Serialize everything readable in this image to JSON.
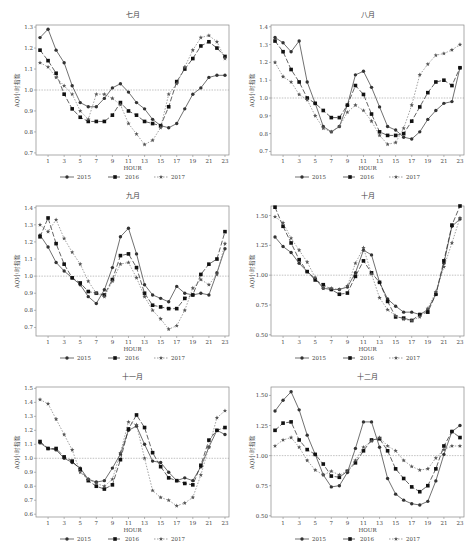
{
  "chart_data": [
    {
      "type": "line",
      "title": "七月",
      "xlabel": "HOUR",
      "ylabel": "AQI小时指数",
      "x": [
        0,
        1,
        2,
        3,
        4,
        5,
        6,
        7,
        8,
        9,
        10,
        11,
        12,
        13,
        14,
        15,
        16,
        17,
        18,
        19,
        20,
        21,
        22,
        23
      ],
      "xticks": [
        1,
        3,
        5,
        7,
        9,
        11,
        13,
        15,
        17,
        19,
        21,
        23
      ],
      "ylim": [
        0.69,
        1.31
      ],
      "yticks": [
        0.7,
        0.8,
        0.9,
        1.0,
        1.1,
        1.2,
        1.3
      ],
      "ytick_labels": [
        "0.7",
        "0.8",
        "0.9",
        "1.0",
        "1.1",
        "1.2",
        "1.3"
      ],
      "reference_line": 1.0,
      "series": [
        {
          "name": "2015",
          "values": [
            1.25,
            1.29,
            1.19,
            1.13,
            1.02,
            0.94,
            0.92,
            0.92,
            0.96,
            1.01,
            1.03,
            0.99,
            0.94,
            0.91,
            0.86,
            0.83,
            0.82,
            0.84,
            0.91,
            0.98,
            1.01,
            1.06,
            1.07,
            1.07
          ]
        },
        {
          "name": "2016",
          "values": [
            1.19,
            1.14,
            1.08,
            0.98,
            0.91,
            0.87,
            0.85,
            0.85,
            0.85,
            0.88,
            0.94,
            0.9,
            0.88,
            0.85,
            0.84,
            0.83,
            0.92,
            1.04,
            1.1,
            1.15,
            1.21,
            1.23,
            1.2,
            1.16
          ]
        },
        {
          "name": "2017",
          "values": [
            1.13,
            1.11,
            1.06,
            1.02,
            0.98,
            0.9,
            0.86,
            0.98,
            0.98,
            0.96,
            0.93,
            0.84,
            0.79,
            0.74,
            0.76,
            0.82,
            0.98,
            1.03,
            1.11,
            1.19,
            1.25,
            1.26,
            1.23,
            1.15
          ]
        }
      ]
    },
    {
      "type": "line",
      "title": "八月",
      "xlabel": "HOUR",
      "ylabel": "AQI小时指数",
      "x": [
        0,
        1,
        2,
        3,
        4,
        5,
        6,
        7,
        8,
        9,
        10,
        11,
        12,
        13,
        14,
        15,
        16,
        17,
        18,
        19,
        20,
        21,
        22,
        23
      ],
      "xticks": [
        1,
        3,
        5,
        7,
        9,
        11,
        13,
        15,
        17,
        19,
        21,
        23
      ],
      "ylim": [
        0.68,
        1.41
      ],
      "yticks": [
        0.7,
        0.8,
        0.9,
        1.0,
        1.1,
        1.2,
        1.3,
        1.4
      ],
      "ytick_labels": [
        "0.7",
        "0.8",
        "0.9",
        "1.0",
        "1.1",
        "1.2",
        "1.3",
        "1.4"
      ],
      "reference_line": 1.0,
      "series": [
        {
          "name": "2015",
          "values": [
            1.34,
            1.31,
            1.26,
            1.32,
            1.09,
            0.97,
            0.84,
            0.81,
            0.84,
            0.96,
            1.13,
            1.15,
            1.06,
            0.95,
            0.84,
            0.82,
            0.78,
            0.77,
            0.81,
            0.88,
            0.93,
            0.97,
            0.98,
            1.17
          ]
        },
        {
          "name": "2016",
          "values": [
            1.32,
            1.26,
            1.16,
            1.09,
            1.0,
            0.97,
            0.93,
            0.89,
            0.89,
            0.96,
            1.07,
            1.02,
            0.91,
            0.81,
            0.79,
            0.79,
            0.8,
            0.87,
            0.95,
            1.03,
            1.09,
            1.1,
            1.07,
            1.17
          ]
        },
        {
          "name": "2017",
          "values": [
            1.2,
            1.12,
            1.09,
            1.02,
            0.99,
            0.9,
            0.83,
            0.81,
            0.84,
            0.92,
            0.96,
            0.93,
            0.87,
            0.79,
            0.74,
            0.75,
            0.83,
            0.96,
            1.13,
            1.19,
            1.24,
            1.25,
            1.27,
            1.3
          ]
        }
      ]
    },
    {
      "type": "line",
      "title": "九月",
      "xlabel": "HOUR",
      "ylabel": "AQI小时指数",
      "x": [
        0,
        1,
        2,
        3,
        4,
        5,
        6,
        7,
        8,
        9,
        10,
        11,
        12,
        13,
        14,
        15,
        16,
        17,
        18,
        19,
        20,
        21,
        22,
        23
      ],
      "xticks": [
        1,
        3,
        5,
        7,
        9,
        11,
        13,
        15,
        17,
        19,
        21,
        23
      ],
      "ylim": [
        0.65,
        1.41
      ],
      "yticks": [
        0.7,
        0.8,
        0.9,
        1.0,
        1.1,
        1.2,
        1.3,
        1.4
      ],
      "ytick_labels": [
        "0.7",
        "0.8",
        "0.9",
        "1.0",
        "1.1",
        "1.2",
        "1.3",
        "1.4"
      ],
      "reference_line": 1.0,
      "series": [
        {
          "name": "2015",
          "values": [
            1.24,
            1.17,
            1.08,
            1.03,
            0.99,
            0.95,
            0.88,
            0.84,
            0.92,
            1.05,
            1.23,
            1.28,
            1.13,
            0.95,
            0.89,
            0.87,
            0.85,
            0.94,
            0.9,
            0.89,
            0.9,
            0.89,
            1.02,
            1.16
          ]
        },
        {
          "name": "2016",
          "values": [
            1.23,
            1.34,
            1.19,
            1.07,
            0.99,
            0.96,
            0.91,
            0.9,
            0.89,
            0.98,
            1.12,
            1.13,
            1.05,
            0.9,
            0.83,
            0.82,
            0.81,
            0.81,
            0.87,
            0.89,
            1.01,
            1.07,
            1.1,
            1.26
          ]
        },
        {
          "name": "2017",
          "values": [
            1.3,
            1.26,
            1.33,
            1.22,
            1.14,
            1.07,
            0.97,
            0.9,
            0.88,
            0.97,
            1.07,
            1.08,
            0.99,
            0.88,
            0.8,
            0.75,
            0.69,
            0.71,
            0.8,
            0.93,
            0.98,
            0.95,
            1.01,
            1.19
          ]
        }
      ]
    },
    {
      "type": "line",
      "title": "十月",
      "xlabel": "HOUR",
      "ylabel": "AQI小时指数",
      "x": [
        0,
        1,
        2,
        3,
        4,
        5,
        6,
        7,
        8,
        9,
        10,
        11,
        12,
        13,
        14,
        15,
        16,
        17,
        18,
        19,
        20,
        21,
        22,
        23
      ],
      "xticks": [
        1,
        3,
        5,
        7,
        9,
        11,
        13,
        15,
        17,
        19,
        21,
        23
      ],
      "ylim": [
        0.49,
        1.58
      ],
      "yticks": [
        0.5,
        0.75,
        1.0,
        1.25,
        1.5
      ],
      "ytick_labels": [
        "0.50",
        "0.75",
        "1.00",
        "1.25",
        "1.50"
      ],
      "reference_line": 1.0,
      "series": [
        {
          "name": "2015",
          "values": [
            1.32,
            1.24,
            1.19,
            1.1,
            1.03,
            0.97,
            0.89,
            0.88,
            0.88,
            0.9,
            1.02,
            1.21,
            1.17,
            0.94,
            0.8,
            0.74,
            0.69,
            0.69,
            0.67,
            0.71,
            0.84,
            1.1,
            1.41,
            1.47
          ]
        },
        {
          "name": "2016",
          "values": [
            1.57,
            1.41,
            1.27,
            1.13,
            1.03,
            0.96,
            0.92,
            0.88,
            0.84,
            0.85,
            0.99,
            1.12,
            1.02,
            0.94,
            0.78,
            0.65,
            0.64,
            0.62,
            0.67,
            0.69,
            0.84,
            1.12,
            1.42,
            1.58
          ]
        },
        {
          "name": "2017",
          "values": [
            1.49,
            1.44,
            1.31,
            1.21,
            1.11,
            0.98,
            0.89,
            0.89,
            0.88,
            0.91,
            1.1,
            1.23,
            1.01,
            0.81,
            0.71,
            0.66,
            0.63,
            0.62,
            0.65,
            0.72,
            0.86,
            1.07,
            1.27,
            1.48
          ]
        }
      ]
    },
    {
      "type": "line",
      "title": "十一月",
      "xlabel": "HOUR",
      "ylabel": "AQI小时指数",
      "x": [
        0,
        1,
        2,
        3,
        4,
        5,
        6,
        7,
        8,
        9,
        10,
        11,
        12,
        13,
        14,
        15,
        16,
        17,
        18,
        19,
        20,
        21,
        22,
        23
      ],
      "xticks": [
        1,
        3,
        5,
        7,
        9,
        11,
        13,
        15,
        17,
        19,
        21,
        23
      ],
      "ylim": [
        0.58,
        1.51
      ],
      "yticks": [
        0.6,
        0.7,
        0.8,
        0.9,
        1.0,
        1.1,
        1.2,
        1.3,
        1.4,
        1.5
      ],
      "ytick_labels": [
        "0.6",
        "0.7",
        "0.8",
        "0.9",
        "1.0",
        "1.1",
        "1.2",
        "1.3",
        "1.4",
        "1.5"
      ],
      "reference_line": 1.0,
      "series": [
        {
          "name": "2015",
          "values": [
            1.11,
            1.07,
            1.06,
            1.0,
            0.97,
            0.93,
            0.85,
            0.83,
            0.84,
            0.93,
            1.03,
            1.2,
            1.23,
            1.1,
            0.98,
            0.97,
            0.9,
            0.84,
            0.86,
            0.84,
            0.94,
            1.08,
            1.2,
            1.17
          ]
        },
        {
          "name": "2016",
          "values": [
            1.12,
            1.07,
            1.07,
            1.01,
            0.98,
            0.92,
            0.84,
            0.8,
            0.78,
            0.81,
            0.99,
            1.21,
            1.31,
            1.22,
            1.04,
            0.94,
            0.86,
            0.84,
            0.82,
            0.81,
            0.95,
            1.13,
            1.2,
            1.22
          ]
        },
        {
          "name": "2017",
          "values": [
            1.42,
            1.39,
            1.28,
            1.17,
            1.06,
            0.9,
            0.85,
            0.82,
            0.8,
            0.85,
            1.04,
            1.26,
            1.24,
            1.0,
            0.77,
            0.72,
            0.7,
            0.66,
            0.68,
            0.72,
            0.88,
            1.08,
            1.29,
            1.34
          ]
        }
      ]
    },
    {
      "type": "line",
      "title": "十二月",
      "xlabel": "HOUR",
      "ylabel": "AQI小时指数",
      "x": [
        0,
        1,
        2,
        3,
        4,
        5,
        6,
        7,
        8,
        9,
        10,
        11,
        12,
        13,
        14,
        15,
        16,
        17,
        18,
        19,
        20,
        21,
        22,
        23
      ],
      "xticks": [
        1,
        3,
        5,
        7,
        9,
        11,
        13,
        15,
        17,
        19,
        21,
        23
      ],
      "ylim": [
        0.49,
        1.57
      ],
      "yticks": [
        0.5,
        0.75,
        1.0,
        1.25,
        1.5
      ],
      "ytick_labels": [
        "0.50",
        "0.75",
        "1.00",
        "1.25",
        "1.50"
      ],
      "reference_line": 1.0,
      "series": [
        {
          "name": "2015",
          "values": [
            1.37,
            1.46,
            1.53,
            1.38,
            1.17,
            1.01,
            0.84,
            0.74,
            0.75,
            0.86,
            1.06,
            1.28,
            1.28,
            1.07,
            0.81,
            0.68,
            0.63,
            0.6,
            0.59,
            0.62,
            0.79,
            1.01,
            1.2,
            1.25
          ]
        },
        {
          "name": "2016",
          "values": [
            1.21,
            1.27,
            1.28,
            1.13,
            1.05,
            1.01,
            0.93,
            0.83,
            0.82,
            0.87,
            0.94,
            1.04,
            1.13,
            1.14,
            1.04,
            0.89,
            0.81,
            0.74,
            0.7,
            0.75,
            0.89,
            1.08,
            1.2,
            1.15
          ]
        },
        {
          "name": "2017",
          "values": [
            1.08,
            1.13,
            1.15,
            1.07,
            0.96,
            0.88,
            0.84,
            0.87,
            0.84,
            0.87,
            0.96,
            1.07,
            1.12,
            1.15,
            1.08,
            1.04,
            0.96,
            0.91,
            0.88,
            0.89,
            0.98,
            1.05,
            1.08,
            1.08
          ]
        }
      ]
    }
  ],
  "legend": [
    "2015",
    "2016",
    "2017"
  ]
}
